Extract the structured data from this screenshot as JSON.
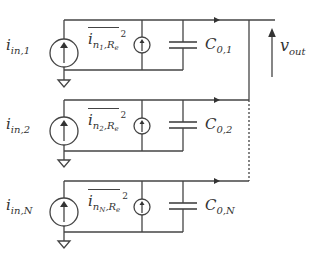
{
  "diagram": {
    "title": "",
    "type": "parallel current-source circuit",
    "stroke_color": "#444444",
    "rows": [
      {
        "id": 1,
        "input_source": {
          "base": "i",
          "sub": "in,1"
        },
        "noise_source": {
          "base": "i",
          "sub": "n",
          "subsub": "1",
          "sub2": ",R",
          "sub2sub": "e",
          "sup": "2"
        },
        "capacitor": {
          "base": "C",
          "sub": "0,1"
        }
      },
      {
        "id": 2,
        "input_source": {
          "base": "i",
          "sub": "in,2"
        },
        "noise_source": {
          "base": "i",
          "sub": "n",
          "subsub": "2",
          "sub2": ",R",
          "sub2sub": "e",
          "sup": "2"
        },
        "capacitor": {
          "base": "C",
          "sub": "0,2"
        }
      },
      {
        "id": "N",
        "input_source": {
          "base": "i",
          "sub": "in,N"
        },
        "noise_source": {
          "base": "i",
          "sub": "n",
          "subsub": "N",
          "sub2": ",R",
          "sub2sub": "e",
          "sup": "2"
        },
        "capacitor": {
          "base": "C",
          "sub": "0,N"
        }
      }
    ],
    "output": {
      "base": "v",
      "sub": "out"
    }
  }
}
